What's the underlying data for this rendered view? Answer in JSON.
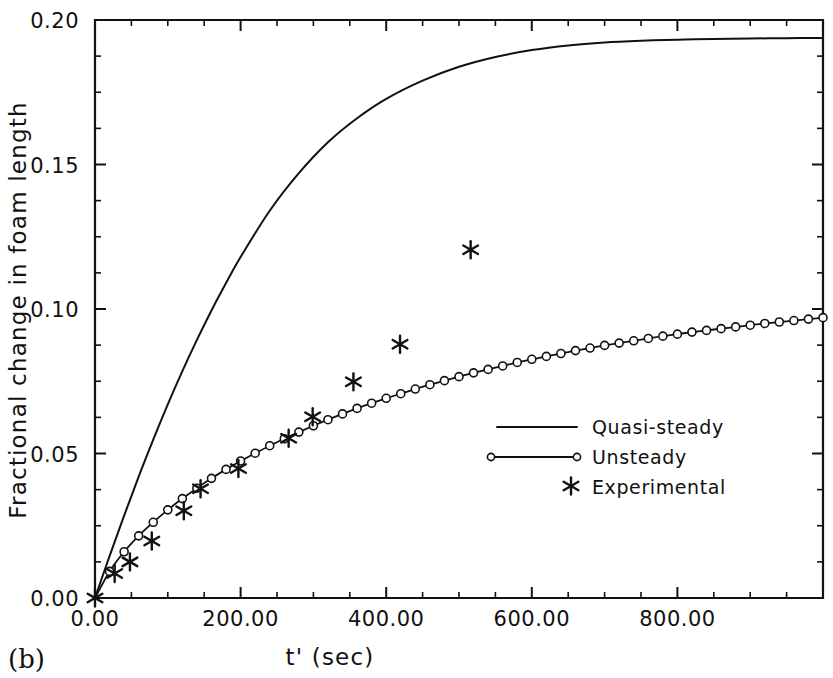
{
  "figure": {
    "panel_label": "(b)",
    "background_color": "#ffffff",
    "ink_color": "#111111"
  },
  "axes": {
    "x_title": "t' (sec)",
    "y_title": "Fractional change in foam length",
    "x_ticks": [
      "0.00",
      "200.00",
      "400.00",
      "600.00",
      "800.00"
    ],
    "y_ticks": [
      "0.00",
      "0.05",
      "0.10",
      "0.15",
      "0.20"
    ]
  },
  "legend": {
    "entries": [
      {
        "label": "Quasi-steady",
        "marker": "line"
      },
      {
        "label": "Unsteady",
        "marker": "line-with-open-circles"
      },
      {
        "label": "Experimental",
        "marker": "asterisk"
      }
    ]
  },
  "chart_data": {
    "type": "line",
    "title": "",
    "subtitle": "",
    "xlabel": "t' (sec)",
    "ylabel": "Fractional change in foam length",
    "xlim": [
      0,
      800
    ],
    "xlim_plot": [
      0,
      1000
    ],
    "ylim": [
      0.0,
      0.2
    ],
    "xticks": [
      0,
      200,
      400,
      600,
      800
    ],
    "yticks": [
      0.0,
      0.05,
      0.1,
      0.15,
      0.2
    ],
    "xtick_labels": [
      "0.00",
      "200.00",
      "400.00",
      "600.00",
      "800.00"
    ],
    "ytick_labels": [
      "0.00",
      "0.05",
      "0.10",
      "0.15",
      "0.20"
    ],
    "x_minor_tick_step": 50,
    "y_minor_tick_step": 0.0125,
    "grid": false,
    "legend_position": "center-right",
    "series": [
      {
        "name": "Quasi-steady",
        "style": "solid-line",
        "marker": "none",
        "x": [
          0,
          20,
          40,
          60,
          80,
          100,
          120,
          140,
          160,
          180,
          200,
          240,
          280,
          320,
          360,
          400,
          450,
          500,
          550,
          600,
          650,
          700,
          750,
          800,
          850,
          900,
          950,
          1000
        ],
        "y": [
          0.0,
          0.0145,
          0.0285,
          0.042,
          0.0548,
          0.067,
          0.0785,
          0.0893,
          0.0995,
          0.109,
          0.118,
          0.134,
          0.147,
          0.1577,
          0.166,
          0.1727,
          0.179,
          0.1838,
          0.1872,
          0.1896,
          0.1912,
          0.1922,
          0.1928,
          0.1932,
          0.1934,
          0.1936,
          0.1937,
          0.1938
        ]
      },
      {
        "name": "Unsteady",
        "style": "solid-line-with-open-circle-markers",
        "marker": "open-circle",
        "x": [
          0,
          20,
          40,
          60,
          80,
          100,
          120,
          140,
          160,
          180,
          200,
          220,
          240,
          260,
          280,
          300,
          320,
          340,
          360,
          380,
          400,
          420,
          440,
          460,
          480,
          500,
          520,
          540,
          560,
          580,
          600,
          620,
          640,
          660,
          680,
          700,
          720,
          740,
          760,
          780,
          800,
          820,
          840,
          860,
          880,
          900,
          920,
          940,
          960,
          980,
          1000
        ],
        "y": [
          0.0,
          0.0092,
          0.016,
          0.0215,
          0.0262,
          0.0305,
          0.0344,
          0.038,
          0.0414,
          0.0445,
          0.0474,
          0.0501,
          0.0527,
          0.0551,
          0.0574,
          0.0596,
          0.0617,
          0.0637,
          0.0656,
          0.0674,
          0.0691,
          0.0707,
          0.0723,
          0.0738,
          0.0752,
          0.0766,
          0.0779,
          0.0791,
          0.0803,
          0.0815,
          0.0826,
          0.0836,
          0.0846,
          0.0856,
          0.0865,
          0.0874,
          0.0882,
          0.089,
          0.0898,
          0.0906,
          0.0913,
          0.092,
          0.0926,
          0.0932,
          0.0938,
          0.0944,
          0.095,
          0.0955,
          0.096,
          0.0965,
          0.097
        ]
      },
      {
        "name": "Experimental",
        "style": "markers-only",
        "marker": "asterisk",
        "x": [
          0,
          27,
          48,
          78,
          122,
          145,
          197,
          266,
          299,
          355,
          419,
          516
        ],
        "y": [
          0.0,
          0.0085,
          0.0125,
          0.0197,
          0.0302,
          0.0378,
          0.0448,
          0.0553,
          0.0627,
          0.0748,
          0.0878,
          0.1205
        ]
      }
    ]
  }
}
